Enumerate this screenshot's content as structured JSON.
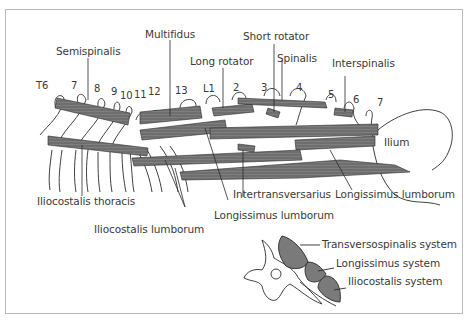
{
  "figure": {
    "type": "anatomical-diagram",
    "colors": {
      "muscle": "#6e6e6e",
      "outline": "#2a2a2a",
      "label": "#3a3a3a",
      "frame": "#b9b9b9",
      "cross_section_muscle": "#7a7a7a"
    }
  },
  "vertebra_labels": {
    "thoracic": [
      "T6",
      "7",
      "8",
      "9",
      "10",
      "11",
      "12",
      "13"
    ],
    "lumbar": [
      "L1",
      "2",
      "3",
      "4",
      "5",
      "6",
      "7"
    ]
  },
  "top_labels": {
    "semispinalis": "Semispinalis",
    "multifidus": "Multifidus",
    "long_rotator": "Long rotator",
    "short_rotator": "Short rotator",
    "spinalis": "Spinalis",
    "interspinalis": "Interspinalis"
  },
  "side_labels": {
    "ilium": "Ilium"
  },
  "bottom_labels": {
    "iliocostalis_thoracis": "Iliocostalis thoracis",
    "iliocostalis_lumborum": "Iliocostalis lumborum",
    "intertransversarius": "Intertransversarius",
    "longissimus_lumborum_center": "Longissimus lumborum",
    "longissimus_lumborum_right": "Longissimus lumborum"
  },
  "cross_section": {
    "legend": [
      "Transversospinalis system",
      "Longissimus system",
      "Iliocostalis system"
    ]
  }
}
